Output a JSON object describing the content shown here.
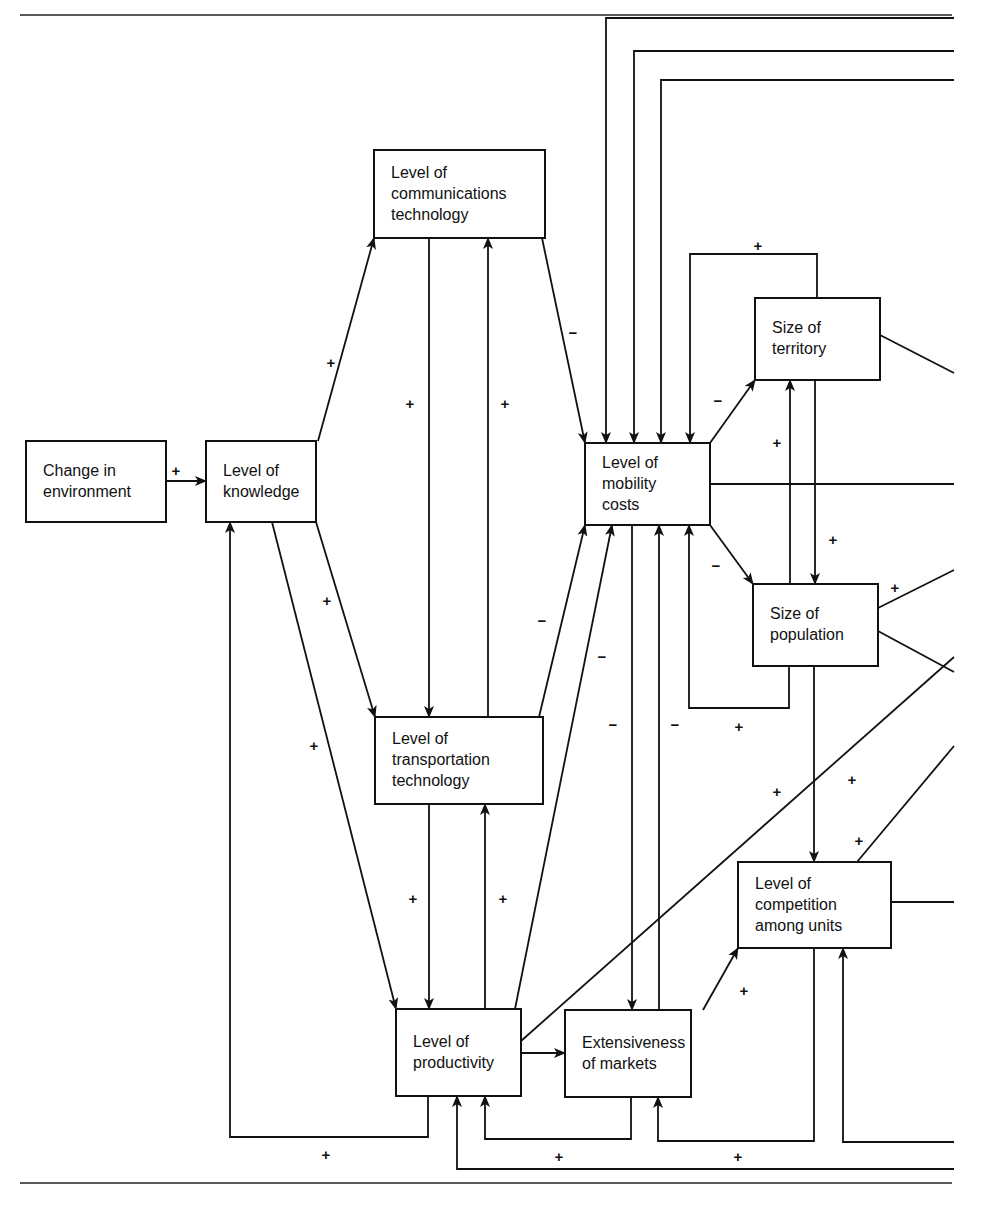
{
  "figure": {
    "type": "causal-loop-diagram",
    "nodes": [
      {
        "id": "environment",
        "lines": [
          "Change in",
          "environment"
        ],
        "box": [
          26,
          441,
          140,
          81
        ]
      },
      {
        "id": "knowledge",
        "lines": [
          "Level of",
          "knowledge"
        ],
        "box": [
          206,
          441,
          110,
          81
        ]
      },
      {
        "id": "communications",
        "lines": [
          "Level of",
          "communications",
          "technology"
        ],
        "box": [
          374,
          150,
          171,
          88
        ]
      },
      {
        "id": "mobility",
        "lines": [
          "Level of",
          "mobility",
          "costs"
        ],
        "box": [
          585,
          443,
          125,
          82
        ]
      },
      {
        "id": "territory",
        "lines": [
          "Size of",
          "territory"
        ],
        "box": [
          755,
          298,
          125,
          82
        ]
      },
      {
        "id": "population",
        "lines": [
          "Size of",
          "population"
        ],
        "box": [
          753,
          584,
          125,
          82
        ]
      },
      {
        "id": "transportation",
        "lines": [
          "Level of",
          "transportation",
          "technology"
        ],
        "box": [
          375,
          717,
          168,
          87
        ]
      },
      {
        "id": "competition",
        "lines": [
          "Level of",
          "competition",
          "among units"
        ],
        "box": [
          738,
          862,
          153,
          86
        ]
      },
      {
        "id": "productivity",
        "lines": [
          "Level of",
          "productivity"
        ],
        "box": [
          396,
          1009,
          125,
          87
        ]
      },
      {
        "id": "markets",
        "lines": [
          "Extensiveness",
          "of markets"
        ],
        "box": [
          565,
          1010,
          126,
          87
        ]
      }
    ],
    "edges": [
      {
        "from": "environment",
        "to": "knowledge",
        "sign": "+",
        "points": [
          [
            166,
            481
          ],
          [
            206,
            481
          ]
        ],
        "arrow": true,
        "label_at": [
          176,
          471
        ]
      },
      {
        "from": "knowledge",
        "to": "communications",
        "sign": "+",
        "points": [
          [
            318,
            441
          ],
          [
            374,
            238
          ]
        ],
        "arrow": true,
        "label_at": [
          331,
          363
        ]
      },
      {
        "from": "knowledge",
        "to": "transportation",
        "sign": "+",
        "points": [
          [
            316,
            522
          ],
          [
            375,
            717
          ]
        ],
        "arrow": true,
        "label_at": [
          327,
          601
        ]
      },
      {
        "from": "knowledge",
        "to": "productivity",
        "sign": "+",
        "points": [
          [
            272,
            522
          ],
          [
            396,
            1009
          ]
        ],
        "arrow": true,
        "label_at": [
          314,
          746
        ]
      },
      {
        "from": "communications",
        "to": "transportation",
        "sign": "+",
        "points": [
          [
            429,
            238
          ],
          [
            429,
            717
          ]
        ],
        "arrow": true,
        "label_at": [
          410,
          404
        ]
      },
      {
        "from": "transportation",
        "to": "communications",
        "sign": "+",
        "points": [
          [
            488,
            717
          ],
          [
            488,
            238
          ]
        ],
        "arrow": true,
        "label_at": [
          505,
          404
        ]
      },
      {
        "from": "communications",
        "to": "mobility",
        "sign": "−",
        "points": [
          [
            542,
            238
          ],
          [
            585,
            443
          ]
        ],
        "arrow": true,
        "label_at": [
          573,
          333
        ]
      },
      {
        "from": "transportation",
        "to": "mobility",
        "sign": "−",
        "points": [
          [
            539,
            717
          ],
          [
            585,
            525
          ]
        ],
        "arrow": true,
        "label_at": [
          542,
          621
        ]
      },
      {
        "from": "productivity",
        "to": "mobility",
        "sign": "−",
        "points": [
          [
            515,
            1009
          ],
          [
            612,
            525
          ]
        ],
        "arrow": true,
        "label_at": [
          602,
          657
        ]
      },
      {
        "from": "transportation",
        "to": "productivity",
        "sign": "+",
        "points": [
          [
            429,
            804
          ],
          [
            429,
            1009
          ]
        ],
        "arrow": true,
        "label_at": [
          413,
          899
        ]
      },
      {
        "from": "productivity",
        "to": "transportation",
        "sign": "+",
        "points": [
          [
            485,
            1009
          ],
          [
            485,
            804
          ]
        ],
        "arrow": true,
        "label_at": [
          503,
          899
        ]
      },
      {
        "from": "mobility",
        "to": "markets",
        "sign": "−",
        "points": [
          [
            632,
            525
          ],
          [
            632,
            1010
          ]
        ],
        "arrow": true,
        "label_at": [
          613,
          725
        ]
      },
      {
        "from": "markets",
        "to": "mobility",
        "sign": "−",
        "points": [
          [
            659,
            1010
          ],
          [
            659,
            525
          ]
        ],
        "arrow": true,
        "label_at": [
          675,
          725
        ]
      },
      {
        "from": "mobility",
        "to": "territory",
        "sign": "−",
        "points": [
          [
            710,
            443
          ],
          [
            755,
            380
          ]
        ],
        "arrow": true,
        "label_at": [
          718,
          401
        ]
      },
      {
        "from": "mobility",
        "to": "population",
        "sign": "−",
        "points": [
          [
            710,
            525
          ],
          [
            753,
            584
          ]
        ],
        "arrow": true,
        "label_at": [
          716,
          566
        ]
      },
      {
        "from": "territory",
        "to": "mobility",
        "sign": "+",
        "points": [
          [
            817,
            298
          ],
          [
            817,
            254
          ],
          [
            690,
            254
          ],
          [
            690,
            443
          ]
        ],
        "arrow": true,
        "label_at": [
          758,
          246
        ]
      },
      {
        "from": "population",
        "to": "mobility",
        "sign": "+",
        "points": [
          [
            789,
            666
          ],
          [
            789,
            708
          ],
          [
            689,
            708
          ],
          [
            689,
            525
          ]
        ],
        "arrow": true,
        "label_at": [
          739,
          727
        ]
      },
      {
        "from": "population",
        "to": "territory",
        "sign": "+",
        "points": [
          [
            790,
            584
          ],
          [
            790,
            380
          ]
        ],
        "arrow": true,
        "label_at": [
          777,
          443
        ]
      },
      {
        "from": "territory",
        "to": "population",
        "sign": "+",
        "points": [
          [
            815,
            380
          ],
          [
            815,
            584
          ]
        ],
        "arrow": true,
        "label_at": [
          833,
          540
        ]
      },
      {
        "from": "population",
        "to": "competition",
        "sign": "+",
        "points": [
          [
            814,
            666
          ],
          [
            814,
            862
          ]
        ],
        "arrow": true,
        "label_at": [
          852,
          780
        ]
      },
      {
        "from": "markets",
        "to": "competition",
        "sign": "+",
        "points": [
          [
            703,
            1010
          ],
          [
            738,
            948
          ]
        ],
        "arrow": true,
        "label_at": [
          744,
          991
        ]
      },
      {
        "from": "productivity",
        "to": "markets",
        "sign": "",
        "points": [
          [
            521,
            1053
          ],
          [
            565,
            1053
          ]
        ],
        "arrow": true
      },
      {
        "from": "productivity",
        "to": "knowledge",
        "sign": "+",
        "points": [
          [
            428,
            1096
          ],
          [
            428,
            1137
          ],
          [
            230,
            1137
          ],
          [
            230,
            522
          ]
        ],
        "arrow": true,
        "label_at": [
          326,
          1155
        ]
      },
      {
        "from": "markets",
        "to": "productivity",
        "sign": "+",
        "points": [
          [
            631,
            1097
          ],
          [
            631,
            1139
          ],
          [
            485,
            1139
          ],
          [
            485,
            1096
          ]
        ],
        "arrow": true,
        "label_at": [
          559,
          1157
        ]
      },
      {
        "from": "competition",
        "to": "markets",
        "sign": "+",
        "points": [
          [
            814,
            948
          ],
          [
            814,
            1141
          ],
          [
            658,
            1141
          ],
          [
            658,
            1097
          ]
        ],
        "arrow": true,
        "label_at": [
          738,
          1157
        ]
      },
      {
        "from": "offpage",
        "to": "competition",
        "sign": "",
        "points": [
          [
            954,
            1142
          ],
          [
            843,
            1142
          ],
          [
            843,
            948
          ]
        ],
        "arrow": true
      },
      {
        "from": "offpage",
        "to": "productivity",
        "sign": "",
        "points": [
          [
            954,
            1169
          ],
          [
            457,
            1169
          ],
          [
            457,
            1096
          ]
        ],
        "arrow": true
      },
      {
        "from": "offpage",
        "to": "mobility",
        "sign": "",
        "points": [
          [
            954,
            18
          ],
          [
            606,
            18
          ],
          [
            606,
            443
          ]
        ],
        "arrow": true
      },
      {
        "from": "offpage",
        "to": "mobility",
        "sign": "",
        "points": [
          [
            954,
            51
          ],
          [
            634,
            51
          ],
          [
            634,
            443
          ]
        ],
        "arrow": true
      },
      {
        "from": "offpage",
        "to": "mobility",
        "sign": "",
        "points": [
          [
            954,
            80
          ],
          [
            661,
            80
          ],
          [
            661,
            443
          ]
        ],
        "arrow": true
      },
      {
        "from": "mobility",
        "to": "offpage",
        "sign": "",
        "points": [
          [
            710,
            484
          ],
          [
            954,
            484
          ]
        ],
        "arrow": false
      },
      {
        "from": "territory",
        "to": "offpage",
        "sign": "",
        "points": [
          [
            880,
            335
          ],
          [
            954,
            373
          ]
        ],
        "arrow": false
      },
      {
        "from": "population",
        "to": "offpage",
        "sign": "+",
        "points": [
          [
            878,
            608
          ],
          [
            954,
            570
          ]
        ],
        "arrow": false,
        "label_at": [
          895,
          588
        ]
      },
      {
        "from": "population",
        "to": "offpage",
        "sign": "",
        "points": [
          [
            878,
            631
          ],
          [
            954,
            672
          ]
        ],
        "arrow": false
      },
      {
        "from": "productivity",
        "to": "offpage",
        "sign": "+",
        "points": [
          [
            521,
            1041
          ],
          [
            954,
            657
          ]
        ],
        "arrow": false,
        "label_at": [
          777,
          792
        ]
      },
      {
        "from": "competition",
        "to": "offpage",
        "sign": "+",
        "points": [
          [
            857,
            862
          ],
          [
            954,
            746
          ]
        ],
        "arrow": false,
        "label_at": [
          859,
          841
        ]
      },
      {
        "from": "competition",
        "to": "offpage",
        "sign": "",
        "points": [
          [
            891,
            902
          ],
          [
            954,
            902
          ]
        ],
        "arrow": false
      }
    ],
    "rules": {
      "top_y": 15,
      "bottom_y": 1183,
      "x1": 20,
      "x2": 952
    }
  }
}
